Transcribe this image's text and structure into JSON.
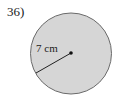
{
  "problem": {
    "number_label": "36)"
  },
  "figure": {
    "shape": "circle",
    "radius_label": "7 cm",
    "radius_value": 7,
    "radius_unit": "cm",
    "colors": {
      "fill": "#d6d6d6",
      "stroke": "#6a6a6a",
      "line": "#222222",
      "text": "#222222"
    }
  }
}
